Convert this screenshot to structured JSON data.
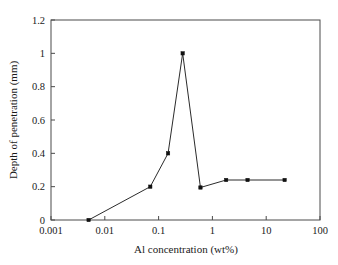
{
  "chart_data": {
    "type": "line",
    "title": "",
    "xlabel": "Al concentration (wt%)",
    "ylabel": "Depth of penetration (mm)",
    "xscale": "log",
    "yscale": "linear",
    "xlim": [
      0.001,
      100
    ],
    "ylim": [
      0,
      1.2
    ],
    "grid": false,
    "legend": false,
    "x_ticks": [
      0.001,
      0.01,
      0.1,
      1,
      10,
      100
    ],
    "x_tick_labels": [
      "0.001",
      "0.01",
      "0.1",
      "1",
      "10",
      "100"
    ],
    "y_ticks": [
      0,
      0.2,
      0.4,
      0.6,
      0.8,
      1,
      1.2
    ],
    "y_tick_labels": [
      "0",
      "0.2",
      "0.4",
      "0.6",
      "0.8",
      "1",
      "1.2"
    ],
    "series": [
      {
        "name": "Depth of penetration",
        "marker": "square",
        "marker_color": "#111111",
        "line_color": "#2b2b2b",
        "x": [
          0.005,
          0.07,
          0.15,
          0.28,
          0.6,
          1.8,
          4.5,
          22
        ],
        "y": [
          0,
          0.2,
          0.4,
          1.0,
          0.195,
          0.24,
          0.24,
          0.24
        ]
      }
    ]
  },
  "figure": {
    "background": "#ffffff",
    "axis_color": "#4a4a4a"
  }
}
